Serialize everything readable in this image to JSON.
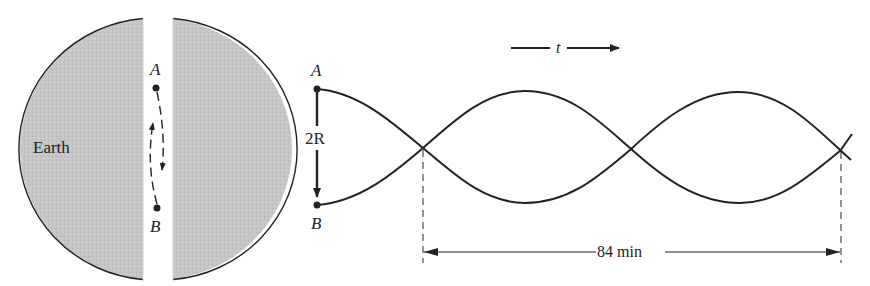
{
  "earth_panel": {
    "earth_label": "Earth",
    "point_a_label": "A",
    "point_b_label": "B",
    "earth_fill": "#c4c4c4",
    "outline_color": "#222222"
  },
  "oscillation_panel": {
    "point_a_label": "A",
    "point_b_label": "B",
    "amplitude_label": "2R",
    "time_axis_label": "t",
    "period_label": "84 min"
  }
}
